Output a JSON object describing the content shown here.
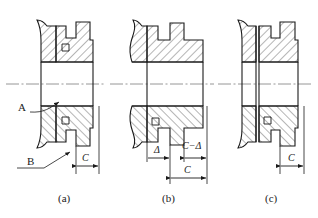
{
  "drawing": {
    "title": "Shaft-hub assembly cross-sections",
    "stroke_color": "#1a1a1a",
    "hatch_color": "#2a2a2a",
    "centerline_color": "#8a8a8a",
    "background": "#ffffff"
  },
  "figures": [
    {
      "id": "a",
      "caption": "(a)",
      "callouts": [
        {
          "name": "callout-a",
          "text": "A"
        },
        {
          "name": "callout-b",
          "text": "B"
        }
      ],
      "dimensions": [
        {
          "name": "dimension-c",
          "text": "C"
        }
      ]
    },
    {
      "id": "b",
      "caption": "(b)",
      "callouts": [],
      "dimensions": [
        {
          "name": "dimension-delta",
          "text": "Δ"
        },
        {
          "name": "dimension-c-minus-delta",
          "text": "C−Δ"
        },
        {
          "name": "dimension-c",
          "text": "C"
        }
      ]
    },
    {
      "id": "c",
      "caption": "(c)",
      "callouts": [],
      "dimensions": [
        {
          "name": "dimension-c",
          "text": "C"
        }
      ]
    }
  ]
}
